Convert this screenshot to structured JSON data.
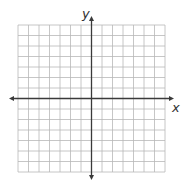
{
  "diagram": {
    "type": "coordinate-plane",
    "axes": {
      "x_label": "x",
      "y_label": "y",
      "arrows": "both-ends"
    },
    "grid": {
      "columns": 14,
      "rows": 14,
      "cells_left_of_y_axis": 7,
      "cells_above_x_axis": 7,
      "tick_labels": false
    },
    "colors": {
      "grid_line": "#b8b8b8",
      "axis_line": "#3a3a3a",
      "label": "#333333",
      "background": "#ffffff"
    }
  }
}
